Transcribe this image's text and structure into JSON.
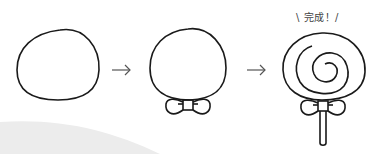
{
  "steps": [
    {
      "name": "step-1-head-outline"
    },
    {
      "name": "step-2-add-bow"
    },
    {
      "name": "step-3-spiral-and-stick"
    }
  ],
  "arrows": [
    "→",
    "→"
  ],
  "caption": "\\ 完成！/",
  "colors": {
    "stroke": "#1a1a1a",
    "arrow": "#555555",
    "background_swoosh": "#ececec"
  }
}
